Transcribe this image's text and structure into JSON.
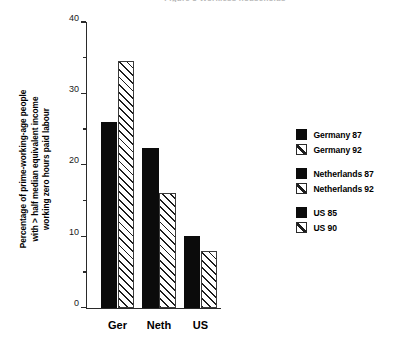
{
  "clipped_title": "Figure 3  Workless households",
  "chart_data": {
    "type": "bar",
    "title": "",
    "xlabel": "",
    "ylabel": "Percentage of prime-working-age people\nwith > half median equivalent income\nworking zero hours paid labour",
    "categories": [
      "Ger",
      "Neth",
      "US"
    ],
    "ylim": [
      0,
      40
    ],
    "ytick_labels": [
      "0",
      "10",
      "20",
      "30",
      "40"
    ],
    "ytick_values": [
      0,
      10,
      20,
      30,
      40
    ],
    "yminor_values": [
      5,
      15,
      25,
      35
    ],
    "grid": false,
    "legend_position": "right",
    "series": [
      {
        "name": "Germany 87",
        "fill": "solid",
        "category": "Ger",
        "value": 26.0
      },
      {
        "name": "Germany 92",
        "fill": "hatch",
        "category": "Ger",
        "value": 34.5
      },
      {
        "name": "Netherlands 87",
        "fill": "solid",
        "category": "Neth",
        "value": 22.3
      },
      {
        "name": "Netherlands 92",
        "fill": "hatch",
        "category": "Neth",
        "value": 16.0
      },
      {
        "name": "US  85",
        "fill": "solid",
        "category": "US",
        "value": 10.0
      },
      {
        "name": "US 90",
        "fill": "hatch",
        "category": "US",
        "value": 8.0
      }
    ],
    "legend_groups": [
      [
        {
          "label": "Germany 87",
          "fill": "solid"
        },
        {
          "label": "Germany 92",
          "fill": "hatch"
        }
      ],
      [
        {
          "label": "Netherlands 87",
          "fill": "solid"
        },
        {
          "label": "Netherlands 92",
          "fill": "hatch"
        }
      ],
      [
        {
          "label": "US  85",
          "fill": "solid"
        },
        {
          "label": "US 90",
          "fill": "hatch"
        }
      ]
    ],
    "colors": {
      "solid_fill": "#0b0b0b",
      "hatch_line": "#1d1d1d",
      "hatch_bg": "#ffffff",
      "axis": "#2a2a2a",
      "text": "#000000"
    }
  }
}
